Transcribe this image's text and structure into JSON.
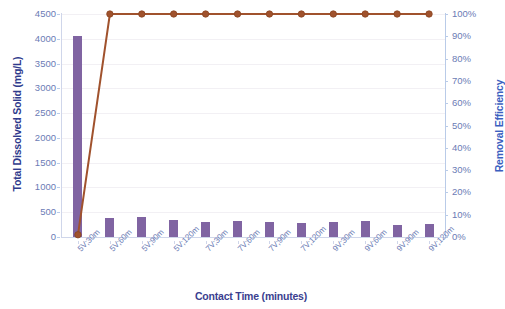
{
  "chart_data": {
    "type": "bar",
    "title": "",
    "xlabel": "Contact Time (minutes)",
    "ylabel": "Total Dissolved Solid (mg/L)",
    "y2label": "Removal Efficiency",
    "categories": [
      "5V;30m",
      "5V;60m",
      "5V;90m",
      "5V;120m",
      "7V;30m",
      "7V;60m",
      "7V;90m",
      "7V;120m",
      "9V;30m",
      "9V;60m",
      "9V;90m",
      "9V;120m"
    ],
    "ylim": [
      0,
      4500
    ],
    "y2lim": [
      0,
      1
    ],
    "yticks": [
      "0",
      "500",
      "1000",
      "1500",
      "2000",
      "2500",
      "3000",
      "3500",
      "4000",
      "4500"
    ],
    "ytick_values": [
      0,
      500,
      1000,
      1500,
      2000,
      2500,
      3000,
      3500,
      4000,
      4500
    ],
    "y2ticks": [
      "0%",
      "10%",
      "20%",
      "30%",
      "40%",
      "50%",
      "60%",
      "70%",
      "80%",
      "90%",
      "100%"
    ],
    "y2tick_values": [
      0,
      10,
      20,
      30,
      40,
      50,
      60,
      70,
      80,
      90,
      100
    ],
    "grid": true,
    "legend": "none",
    "series": [
      {
        "name": "Total Dissolved Solid (mg/L)",
        "type": "bar",
        "axis": "left",
        "color": "#8064a2",
        "values": [
          4050,
          390,
          400,
          350,
          310,
          330,
          300,
          290,
          300,
          320,
          250,
          260
        ]
      },
      {
        "name": "Removal Efficiency",
        "type": "line",
        "axis": "right",
        "color": "#a0522d",
        "marker": "circle",
        "values": [
          1,
          100,
          100,
          100,
          100,
          100,
          100,
          100,
          100,
          100,
          100,
          100
        ]
      }
    ]
  }
}
